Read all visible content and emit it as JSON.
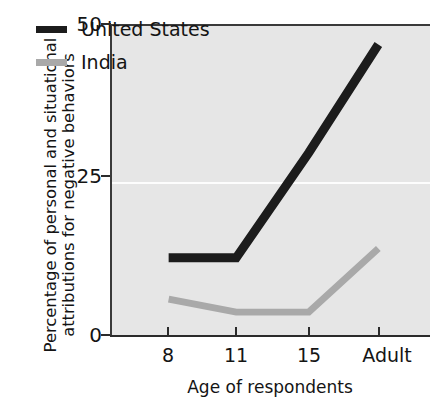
{
  "chart_data": {
    "type": "line",
    "title": "",
    "xlabel": "Age of respondents",
    "ylabel_lines": [
      "Percentage of personal and situational",
      "attributions for negative behaviors"
    ],
    "ylabel": "Percentage of personal and situational attributions for negative behaviors",
    "categories": [
      "8",
      "11",
      "15",
      "Adult"
    ],
    "xtick_labels": [
      "8",
      "11",
      "15",
      "Adult"
    ],
    "ytick_labels": [
      "0",
      "25",
      "50"
    ],
    "yticks": [
      0,
      25,
      50
    ],
    "ylim": [
      0,
      50
    ],
    "grid": "horizontal-gridline-at-25",
    "legend_position": "top-left-inside",
    "plot_background": "#e6e6e6",
    "series": [
      {
        "name": "United States",
        "color": "#1c1c1c",
        "values": [
          12.5,
          12.5,
          29.5,
          47
        ]
      },
      {
        "name": "India",
        "color": "#a9a9a9",
        "values": [
          5.8,
          3.7,
          3.7,
          14
        ]
      }
    ]
  },
  "legend": {
    "items": [
      {
        "label": "United States",
        "color": "#1c1c1c"
      },
      {
        "label": "India",
        "color": "#a9a9a9"
      }
    ]
  },
  "axes": {
    "y_title_line1": "Percentage of personal and situational",
    "y_title_line2": "attributions for negative behaviors",
    "x_title": "Age of respondents",
    "y_tick_0": "0",
    "y_tick_25": "25",
    "y_tick_50": "50",
    "x_tick_0": "8",
    "x_tick_1": "11",
    "x_tick_2": "15",
    "x_tick_3": "Adult"
  }
}
